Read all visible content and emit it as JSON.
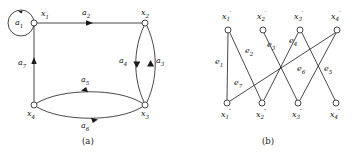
{
  "figure": {
    "kind": "two-panel graph figure",
    "panels": [
      {
        "id": "a",
        "caption": "(a)",
        "type": "directed-graph",
        "nodes": [
          {
            "id": "x1",
            "label": "x",
            "sub": "1",
            "x": 34,
            "y": 23,
            "label_x": 41,
            "label_y": 10
          },
          {
            "id": "x2",
            "label": "x",
            "sub": "2",
            "x": 145,
            "y": 23,
            "label_x": 141,
            "label_y": 9
          },
          {
            "id": "x3",
            "label": "x",
            "sub": "3",
            "x": 145,
            "y": 105,
            "label_x": 141,
            "label_y": 111
          },
          {
            "id": "x4",
            "label": "x",
            "sub": "4",
            "x": 34,
            "y": 105,
            "label_x": 29,
            "label_y": 111
          }
        ],
        "arcs": [
          {
            "id": "a1",
            "label": "a",
            "sub": "1",
            "from": "x1",
            "to": "x1",
            "kind": "self-loop",
            "label_x": 18,
            "label_y": 18
          },
          {
            "id": "a2",
            "label": "a",
            "sub": "2",
            "from": "x1",
            "to": "x2",
            "kind": "straight",
            "label_x": 84,
            "label_y": 10
          },
          {
            "id": "a3",
            "label": "a",
            "sub": "3",
            "from": "x3",
            "to": "x2",
            "kind": "curve-right",
            "label_x": 152,
            "label_y": 60
          },
          {
            "id": "a4",
            "label": "a",
            "sub": "4",
            "from": "x2",
            "to": "x3",
            "kind": "curve-left",
            "label_x": 125,
            "label_y": 60
          },
          {
            "id": "a5",
            "label": "a",
            "sub": "5",
            "from": "x3",
            "to": "x4",
            "kind": "curve-up",
            "label_x": 84,
            "label_y": 79
          },
          {
            "id": "a6",
            "label": "a",
            "sub": "6",
            "from": "x4",
            "to": "x3",
            "kind": "curve-down",
            "label_x": 84,
            "label_y": 124
          },
          {
            "id": "a7",
            "label": "a",
            "sub": "7",
            "from": "x4",
            "to": "x1",
            "kind": "straight",
            "label_x": 20,
            "label_y": 62
          }
        ]
      },
      {
        "id": "b",
        "caption": "(b)",
        "type": "bipartite-graph",
        "top_nodes": [
          {
            "id": "x1p",
            "label": "x",
            "sub": "1",
            "sup": "′",
            "x": 50,
            "y": 30,
            "label_x": 44,
            "label_y": 11
          },
          {
            "id": "x2p",
            "label": "x",
            "sub": "2",
            "sup": "′",
            "x": 85,
            "y": 30,
            "label_x": 79,
            "label_y": 11
          },
          {
            "id": "x3p",
            "label": "x",
            "sub": "3",
            "sup": "′",
            "x": 122,
            "y": 30,
            "label_x": 116,
            "label_y": 11
          },
          {
            "id": "x4p",
            "label": "x",
            "sub": "4",
            "sup": "′",
            "x": 159,
            "y": 30,
            "label_x": 153,
            "label_y": 11
          }
        ],
        "bottom_nodes": [
          {
            "id": "x1pp",
            "label": "x",
            "sub": "1",
            "sup": "″",
            "x": 49,
            "y": 103,
            "label_x": 43,
            "label_y": 110
          },
          {
            "id": "x2pp",
            "label": "x",
            "sub": "2",
            "sup": "″",
            "x": 84,
            "y": 103,
            "label_x": 78,
            "label_y": 110
          },
          {
            "id": "x3pp",
            "label": "x",
            "sub": "3",
            "sup": "″",
            "x": 120,
            "y": 103,
            "label_x": 114,
            "label_y": 110
          },
          {
            "id": "x4pp",
            "label": "x",
            "sub": "4",
            "sup": "″",
            "x": 158,
            "y": 103,
            "label_x": 152,
            "label_y": 110
          }
        ],
        "edges": [
          {
            "id": "e1",
            "label": "e",
            "sub": "1",
            "from": "x1p",
            "to": "x1pp",
            "label_x": 38,
            "label_y": 61
          },
          {
            "id": "e2",
            "label": "e",
            "sub": "2",
            "from": "x1p",
            "to": "x2pp",
            "label_x": 70,
            "label_y": 50
          },
          {
            "id": "e3",
            "label": "e",
            "sub": "3",
            "from": "x2p",
            "to": "x3pp",
            "label_x": 91,
            "label_y": 44
          },
          {
            "id": "e4",
            "label": "e",
            "sub": "4",
            "from": "x3p",
            "to": "x2pp",
            "label_x": 113,
            "label_y": 40
          },
          {
            "id": "e5",
            "label": "e",
            "sub": "5",
            "from": "x4p",
            "to": "x3pp",
            "label_x": 148,
            "label_y": 68
          },
          {
            "id": "e6",
            "label": "e",
            "sub": "6",
            "from": "x3p",
            "to": "x4pp",
            "label_x": 121,
            "label_y": 68
          },
          {
            "id": "e7",
            "label": "e",
            "sub": "7",
            "from": "x4p",
            "to": "x1pp",
            "label_x": 58,
            "label_y": 82
          }
        ]
      }
    ]
  }
}
